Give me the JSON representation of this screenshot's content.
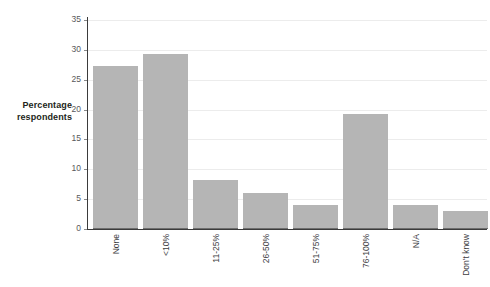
{
  "chart_data": {
    "type": "bar",
    "title": "",
    "xlabel": "",
    "ylabel": "Percentage respondents",
    "ylabel_lines": [
      "Percentage",
      "respondents"
    ],
    "categories": [
      "None",
      "<10%",
      "11-25%",
      "26-50%",
      "51-75%",
      "76-100%",
      "N/A",
      "Don't know"
    ],
    "values": [
      27.3,
      29.3,
      8.2,
      6.1,
      4.0,
      19.3,
      4.0,
      3.0
    ],
    "ylim": [
      0,
      35
    ],
    "ytick_labels": [
      "35",
      "30",
      "25",
      "20",
      "15",
      "10",
      "5",
      "0"
    ],
    "ytick_values": [
      35,
      30,
      25,
      20,
      15,
      10,
      5,
      0
    ],
    "grid": true,
    "legend": false,
    "colors": {
      "bar_fill": "#b5b5b5",
      "bar_edge": "#6e6e6e",
      "gridline": "#ececec",
      "axis_line": "#3b3b3b",
      "tick_text": "#58585a",
      "label_text": "#3d3d3f",
      "background": "#ffffff"
    }
  }
}
